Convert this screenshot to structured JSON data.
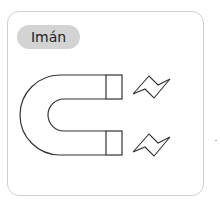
{
  "card": {
    "label": "Imán",
    "illustration": "horseshoe-magnet-with-force-zigzags"
  },
  "colors": {
    "card_border": "#cfcfcf",
    "label_bg": "#d3d3d3",
    "stroke": "#333333"
  }
}
